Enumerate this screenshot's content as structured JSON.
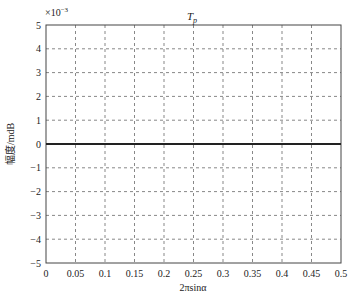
{
  "chart_data": {
    "type": "line",
    "title_main": "T",
    "title_sub": "p",
    "xlabel": "2πsinα",
    "ylabel": "幅度/mdB",
    "y_multiplier": "×10",
    "y_multiplier_exp": "−3",
    "xlim": [
      0,
      0.5
    ],
    "ylim": [
      -5,
      5
    ],
    "x_ticks": [
      0,
      0.05,
      0.1,
      0.15,
      0.2,
      0.25,
      0.3,
      0.35,
      0.4,
      0.45,
      0.5
    ],
    "x_tick_labels": [
      "0",
      "0.05",
      "0.1",
      "0.15",
      "0.2",
      "0.25",
      "0.3",
      "0.35",
      "0.4",
      "0.45",
      "0.5"
    ],
    "y_ticks": [
      5,
      4,
      3,
      2,
      1,
      0,
      -1,
      -2,
      -3,
      -4,
      -5
    ],
    "y_tick_labels": [
      "5",
      "4",
      "3",
      "2",
      "1",
      "0",
      "−1",
      "−2",
      "−3",
      "−4",
      "−5"
    ],
    "grid": true,
    "legend": null,
    "series": [
      {
        "name": "T_p",
        "color": "#222222",
        "x": [
          0,
          0.05,
          0.1,
          0.15,
          0.2,
          0.25,
          0.3,
          0.35,
          0.4,
          0.45,
          0.5
        ],
        "values": [
          0,
          0,
          0,
          0,
          0,
          0,
          0,
          0,
          0,
          0,
          0
        ]
      }
    ]
  }
}
